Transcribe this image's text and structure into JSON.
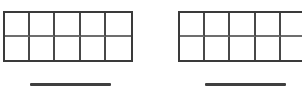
{
  "worksheet": {
    "background_color": "#ffffff",
    "frame_border_color": "#3a3a3a",
    "grid_line_color": "#484848",
    "answer_line_color": "#3f3f3f",
    "problem_count": 2,
    "problems": [
      {
        "id": "problem-1",
        "frame_type": "ten-frame",
        "columns": 5,
        "rows": 2,
        "total_cells": 10,
        "filled_cells": 0,
        "cells": [
          {
            "index": 1,
            "filled": false,
            "value": ""
          },
          {
            "index": 2,
            "filled": false,
            "value": ""
          },
          {
            "index": 3,
            "filled": false,
            "value": ""
          },
          {
            "index": 4,
            "filled": false,
            "value": ""
          },
          {
            "index": 5,
            "filled": false,
            "value": ""
          },
          {
            "index": 6,
            "filled": false,
            "value": ""
          },
          {
            "index": 7,
            "filled": false,
            "value": ""
          },
          {
            "index": 8,
            "filled": false,
            "value": ""
          },
          {
            "index": 9,
            "filled": false,
            "value": ""
          },
          {
            "index": 10,
            "filled": false,
            "value": ""
          }
        ],
        "answer_line": {
          "value": "",
          "placeholder": ""
        }
      },
      {
        "id": "problem-2",
        "frame_type": "ten-frame",
        "columns": 5,
        "rows": 2,
        "total_cells": 10,
        "filled_cells": 0,
        "clipped_at_right_edge": true,
        "cells": [
          {
            "index": 1,
            "filled": false,
            "value": ""
          },
          {
            "index": 2,
            "filled": false,
            "value": ""
          },
          {
            "index": 3,
            "filled": false,
            "value": ""
          },
          {
            "index": 4,
            "filled": false,
            "value": ""
          },
          {
            "index": 5,
            "filled": false,
            "value": ""
          },
          {
            "index": 6,
            "filled": false,
            "value": ""
          },
          {
            "index": 7,
            "filled": false,
            "value": ""
          },
          {
            "index": 8,
            "filled": false,
            "value": ""
          },
          {
            "index": 9,
            "filled": false,
            "value": ""
          },
          {
            "index": 10,
            "filled": false,
            "value": ""
          }
        ],
        "answer_line": {
          "value": "",
          "placeholder": ""
        }
      }
    ]
  }
}
